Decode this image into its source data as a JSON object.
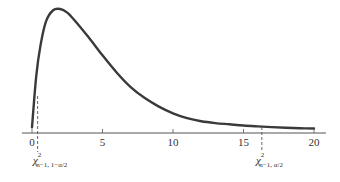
{
  "chart_data": {
    "type": "line",
    "title": "",
    "subtitle": "",
    "xlabel": "",
    "ylabel": "",
    "xlim": [
      0,
      20
    ],
    "x_ticks": [
      0,
      5,
      10,
      15,
      20
    ],
    "x_tick_labels": [
      "0",
      "5",
      "10",
      "15",
      "20"
    ],
    "grid": false,
    "legend": null,
    "series": [
      {
        "name": "chi-square density",
        "x": [
          0,
          0.3,
          0.6,
          1,
          1.5,
          2,
          2.5,
          3,
          4,
          5,
          6,
          7,
          8,
          9,
          10,
          11,
          12,
          13,
          14,
          15,
          16,
          17,
          18,
          19,
          20
        ],
        "y_relative": [
          0.03,
          0.45,
          0.7,
          0.9,
          0.99,
          1.0,
          0.97,
          0.91,
          0.77,
          0.62,
          0.48,
          0.36,
          0.27,
          0.2,
          0.145,
          0.105,
          0.08,
          0.065,
          0.055,
          0.045,
          0.038,
          0.032,
          0.027,
          0.023,
          0.02
        ]
      }
    ],
    "annotations": [
      {
        "type": "dashed-vline",
        "x": 0.4,
        "label": "χ²_{n−1, 1−α/2}",
        "label_main": "χ",
        "label_sup": "2",
        "label_sub": "n−1, 1−α/2"
      },
      {
        "type": "dashed-vline",
        "x": 16.3,
        "label": "χ²_{n−1, α/2}",
        "label_main": "χ",
        "label_sup": "2",
        "label_sub": "n−1, α/2"
      }
    ],
    "colors": {
      "curve": "#3a3a3a",
      "axis": "#555555",
      "dashed": "#555555"
    }
  }
}
